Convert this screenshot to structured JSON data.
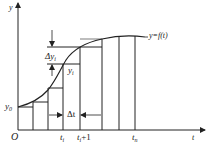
{
  "diagram": {
    "colors": {
      "line": "#222222",
      "background": "#ffffff"
    },
    "axes": {
      "x_label": "t",
      "y_label": "y",
      "origin_label": "O"
    },
    "curve_label": "y=f(t)",
    "labels": {
      "y0": "y",
      "y0_sub": "0",
      "yi": "y",
      "yi_sub": "i",
      "delta_y": "Δy",
      "delta_y_sub": "i",
      "delta_t": "Δt",
      "ti": "t",
      "ti_sub": "i",
      "ti1": "t",
      "ti1_sub": "i",
      "ti1_suffix": "+1",
      "tn": "t",
      "tn_sub": "n"
    }
  }
}
